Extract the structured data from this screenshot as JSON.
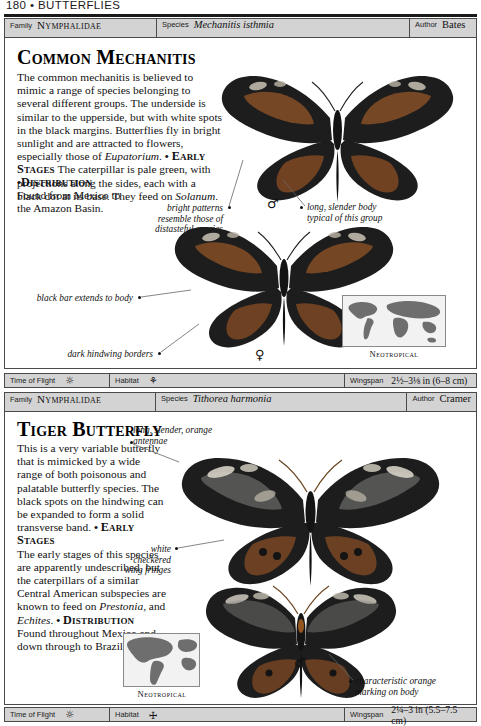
{
  "running_head": "180 • BUTTERFLIES",
  "labels": {
    "family": "Family",
    "species": "Species",
    "author": "Author",
    "time_of_flight": "Time of Flight",
    "habitat": "Habitat",
    "wingspan": "Wingspan"
  },
  "entries": [
    {
      "family": "Nymphalidae",
      "species": "Mechanitis isthmia",
      "author": "Bates",
      "title": "Common Mechanitis",
      "description": "The common mechanitis is believed to mimic a range of species belonging to several different groups. The underside is similar to the upperside, but with white spots in the black margins. Butterflies fly in bright sunlight and are attracted to flowers, especially those of ",
      "description_italic": "Eupatorium",
      "description_tail": ".",
      "early_stages_heading": "Early Stages",
      "early_stages": "The caterpillar is pale green, with projections along the sides, each with a black dot at its base. They feed on ",
      "early_stages_italic": "Solanum",
      "early_stages_tail": ".",
      "distribution_heading": "Distribution",
      "distribution": "Found from Mexico to the Amazon Basin.",
      "annotations": [
        "bright patterns resemble those of distasteful species",
        "long, slender body typical of this group",
        "black bar extends to body",
        "dark hindwing borders"
      ],
      "gender_male": "♂",
      "gender_female": "♀",
      "map_label": "Neotropical",
      "time_of_flight_icon": "sun-icon",
      "habitat_icon": "forest-tree-icon",
      "wingspan": "2½–3⅛ in (6–8 cm)"
    },
    {
      "family": "Nymphalidae",
      "species": "Tithorea harmonia",
      "author": "Cramer",
      "title": "Tiger Butterfly",
      "description": "This is a very variable butterfly that is mimicked by a wide range of both poisonous and palatable butterfly species. The black spots on the hindwing can be expanded to form a solid transverse band.",
      "early_stages_heading": "Early Stages",
      "early_stages": "The early stages of this species are apparently undescribed, but the caterpillars of a similar Central American subspecies are known to feed on ",
      "early_stages_italic": "Prestonia",
      "early_stages_mid": ", and ",
      "early_stages_italic2": "Echites",
      "early_stages_tail": ".",
      "distribution_heading": "Distribution",
      "distribution": "Found throughout Mexico and down through to Brazil.",
      "annotations": [
        "long, slender, orange antennae",
        "white checkered wing fringes",
        "characteristic orange marking on body"
      ],
      "gender_male": "♂",
      "map_label": "Neotropical",
      "time_of_flight_icon": "sun-icon",
      "habitat_icon": "leaf-icon",
      "wingspan": "2¼–3 in (5.5–7.5 cm)"
    }
  ],
  "colors": {
    "bar_background": "#d3d3d3",
    "border": "#4a4a4a",
    "text": "#111111",
    "wing_dark": "#1b1b1b",
    "wing_orange": "#8a5a34",
    "map_land": "#6e6e6e"
  }
}
